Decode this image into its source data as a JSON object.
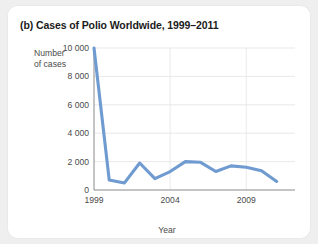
{
  "figure": {
    "label": "(b)",
    "title": "(b) Cases of Polio Worldwide, 1999–2011"
  },
  "axes": {
    "y_title_line1": "Number",
    "y_title_line2": "of cases",
    "x_title": "Year"
  },
  "chart_data": {
    "type": "line",
    "title": "(b) Cases of Polio Worldwide, 1999–2011",
    "xlabel": "Year",
    "ylabel": "Number of cases",
    "x": [
      1999,
      2000,
      2001,
      2002,
      2003,
      2004,
      2005,
      2006,
      2007,
      2008,
      2009,
      2010,
      2011
    ],
    "values": [
      10000,
      700,
      500,
      1900,
      800,
      1300,
      2000,
      1950,
      1300,
      1700,
      1600,
      1350,
      600
    ],
    "series": [
      {
        "name": "Cases of polio worldwide",
        "values": [
          10000,
          700,
          500,
          1900,
          800,
          1300,
          2000,
          1950,
          1300,
          1700,
          1600,
          1350,
          600
        ]
      }
    ],
    "xlim": [
      1999,
      2012.2
    ],
    "ylim": [
      0,
      10000
    ],
    "y_ticks": [
      0,
      2000,
      4000,
      6000,
      8000,
      10000
    ],
    "y_tick_labels": [
      "0",
      "2 000",
      "4 000",
      "6 000",
      "8 000",
      "10 000"
    ],
    "x_ticks": [
      1999,
      2004,
      2009
    ],
    "x_tick_labels": [
      "1999",
      "2004",
      "2009"
    ],
    "grid": "horizontal-and-vertical",
    "legend": "none",
    "line_color": "#6f9bd1",
    "grid_color": "#e0e0e0",
    "axis_color": "#7d7d7d"
  }
}
